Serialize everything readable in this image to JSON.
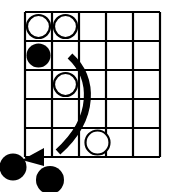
{
  "diagram": {
    "colors": {
      "background": "#ffffff",
      "grid_line": "#000000",
      "black_stone": "#000000",
      "white_stone_fill": "#ffffff",
      "white_stone_stroke": "#000000",
      "arrow": "#000000"
    },
    "grid": {
      "rows": 5,
      "columns": 5,
      "left": 25,
      "top": 12,
      "cell_width": 27,
      "cell_height": 29,
      "line_width": 2.2,
      "label": "5 by 5 grid"
    },
    "stones": [
      {
        "name": "white-stone-r1c1",
        "color": "white",
        "row": 1,
        "column": 1,
        "cx": 38.5,
        "cy": 26.5,
        "r": 11.5
      },
      {
        "name": "white-stone-r1c2",
        "color": "white",
        "row": 1,
        "column": 2,
        "cx": 65.5,
        "cy": 26.5,
        "r": 11.5
      },
      {
        "name": "black-stone-r2c1",
        "color": "black",
        "row": 2,
        "column": 1,
        "cx": 38.5,
        "cy": 55.5,
        "r": 12
      },
      {
        "name": "white-stone-r3c2",
        "color": "white",
        "row": 3,
        "column": 2,
        "cx": 65.5,
        "cy": 84.5,
        "r": 11.5
      },
      {
        "name": "white-stone-r5c3",
        "color": "white",
        "row": 5,
        "column": 3,
        "cx": 97.5,
        "cy": 142.5,
        "r": 12
      }
    ],
    "captured_stones": [
      {
        "name": "captured-black-stone-1",
        "color": "black",
        "cx": 13,
        "cy": 167,
        "r": 13.5
      },
      {
        "name": "captured-black-stone-2",
        "color": "black",
        "cx": 50,
        "cy": 180,
        "r": 14
      }
    ],
    "arrow": {
      "name": "move-arrow",
      "stroke_width": 7,
      "path": "M 70 56 C 94 78 96 118 58 152",
      "head_points": "22,160 44,148 44,166",
      "start": [
        70,
        56
      ],
      "end": [
        22,
        160
      ],
      "description": "curved arrow sweeping from upper middle down to lower left"
    }
  }
}
